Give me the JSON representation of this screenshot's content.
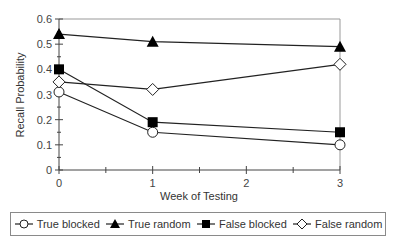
{
  "chart_data": {
    "type": "line",
    "title": "",
    "xlabel": "Week of Testing",
    "ylabel": "Recall Probability",
    "x_ticks": [
      "0",
      "1",
      "2",
      "3"
    ],
    "y_ticks": [
      "0",
      "0.1",
      "0.2",
      "0.3",
      "0.4",
      "0.5",
      "0.6"
    ],
    "xlim": [
      0,
      3
    ],
    "ylim": [
      0,
      0.6
    ],
    "grid": false,
    "legend_position": "bottom",
    "x": [
      0,
      1,
      3
    ],
    "series": [
      {
        "name": "True blocked",
        "marker": "circle-open",
        "values": [
          0.31,
          0.15,
          0.1
        ]
      },
      {
        "name": "True random",
        "marker": "triangle-filled",
        "values": [
          0.54,
          0.51,
          0.49
        ]
      },
      {
        "name": "False blocked",
        "marker": "square-filled",
        "values": [
          0.4,
          0.19,
          0.15
        ]
      },
      {
        "name": "False random",
        "marker": "diamond-open",
        "values": [
          0.35,
          0.32,
          0.42
        ]
      }
    ]
  }
}
